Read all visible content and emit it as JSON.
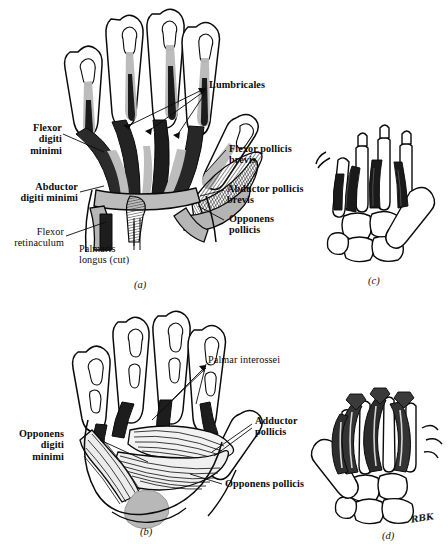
{
  "figure": {
    "artist_signature": "RBK",
    "colors": {
      "ink": "#0a0a0a",
      "muscle_gray": "#b8b8b8",
      "muscle_dark": "#1e1e1e",
      "tendon_gray": "#9a9a9a",
      "paper": "#ffffff"
    }
  },
  "panels": [
    {
      "id": "a",
      "caption": "(a)",
      "view": "palmar-superficial",
      "labels": [
        {
          "text": "Lumbricales",
          "weight": "bold",
          "leader": "arrows-left"
        },
        {
          "text": "Flexor\ndigiti\nminimi",
          "weight": "bold",
          "leader": "line-right"
        },
        {
          "text": "Abductor\ndigiti minimi",
          "weight": "bold",
          "leader": "line-right"
        },
        {
          "text": "Flexor\nretinaculum",
          "weight": "regular",
          "leader": "line-right"
        },
        {
          "text": "Palmaris\nlongus (cut)",
          "weight": "regular",
          "leader": "line-up"
        },
        {
          "text": "Flexor pollicis\nbrevis",
          "weight": "bold",
          "leader": "line-left"
        },
        {
          "text": "Abductor pollicis\nbrevis",
          "weight": "bold",
          "leader": "line-left"
        },
        {
          "text": "Opponens\npollicis",
          "weight": "bold",
          "leader": "line-left"
        }
      ]
    },
    {
      "id": "b",
      "caption": "(b)",
      "view": "palmar-deep",
      "labels": [
        {
          "text": "Palmar interossei",
          "weight": "regular",
          "leader": "lines-left"
        },
        {
          "text": "Opponens\ndigiti\nminimi",
          "weight": "bold",
          "leader": "line-right"
        },
        {
          "text": "Adductor\npollicis",
          "weight": "bold",
          "leader": "line-left"
        },
        {
          "text": "Opponens pollicis",
          "weight": "bold",
          "leader": "line-left"
        }
      ]
    },
    {
      "id": "c",
      "caption": "(c)",
      "view": "palmar-interossei-skeletal",
      "labels": []
    },
    {
      "id": "d",
      "caption": "(d)",
      "view": "dorsal-interossei-skeletal",
      "labels": []
    }
  ],
  "labels_a": {
    "lumbricales": "Lumbricales",
    "flexor_digiti_minimi": "Flexor\ndigiti\nminimi",
    "abductor_digiti_minimi": "Abductor\ndigiti minimi",
    "flexor_retinaculum": "Flexor\nretinaculum",
    "palmaris_longus": "Palmaris\nlongus (cut)",
    "flexor_pollicis_brevis": "Flexor pollicis\nbrevis",
    "abductor_pollicis_brevis": "Abductor pollicis\nbrevis",
    "opponens_pollicis": "Opponens\npollicis",
    "caption": "(a)"
  },
  "labels_b": {
    "palmar_interossei": "Palmar interossei",
    "opponens_digiti_minimi": "Opponens\ndigiti\nminimi",
    "adductor_pollicis": "Adductor\npollicis",
    "opponens_pollicis": "Opponens pollicis",
    "caption": "(b)"
  },
  "labels_c": {
    "caption": "(c)"
  },
  "labels_d": {
    "caption": "(d)",
    "signature": "RBK"
  }
}
